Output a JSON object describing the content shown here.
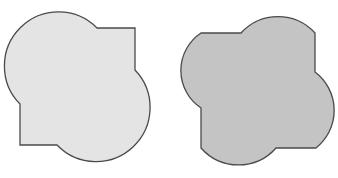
{
  "figure": {
    "shapes": [
      {
        "name": "light-shape",
        "fill": "#e4e4e4",
        "stroke": "#4a4a4a",
        "path": "M 97 28 L 135 28 L 135 70 A 53 53 0 0 1 57 145 L 20 145 L 20 104 A 53 53 0 0 1 97 28 Z"
      },
      {
        "name": "dark-shape",
        "fill": "#c4c4c4",
        "stroke": "#4a4a4a",
        "path": "M 201 33 L 241 33 A 50 50 0 0 1 315 33 L 315 72 A 48 48 0 0 1 316 148 L 276 148 A 50 50 0 0 1 201 148 L 201 108 A 45 45 0 0 1 201 33 Z"
      }
    ]
  }
}
